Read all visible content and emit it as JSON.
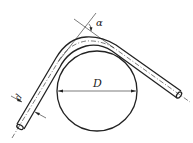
{
  "diagram": {
    "labels": {
      "diameter": "D",
      "angle": "α",
      "pipe_diameter": "d"
    },
    "colors": {
      "stroke": "#222222",
      "background": "#ffffff"
    }
  }
}
